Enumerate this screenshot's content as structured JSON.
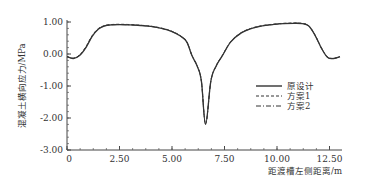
{
  "chart_data": {
    "type": "line",
    "title": "",
    "xlabel": "距渡槽左侧距离/m",
    "ylabel": "混凝土横向应力/MPa",
    "xlim": [
      0,
      13.2
    ],
    "ylim": [
      -3.0,
      1.0
    ],
    "x_ticks": [
      0,
      2.5,
      5.0,
      7.5,
      10.0,
      12.5
    ],
    "x_tick_labels": [
      "0",
      "2.50",
      "5.00",
      "7.50",
      "10.00",
      "12.50"
    ],
    "y_ticks": [
      1.0,
      0.0,
      -1.0,
      -2.0,
      -3.0
    ],
    "y_tick_labels": [
      "1.00",
      "0.00",
      "-1.00",
      "-2.00",
      "-3.00"
    ],
    "grid": false,
    "legend_position": "right-center",
    "x": [
      0,
      0.3,
      0.6,
      0.9,
      1.2,
      1.5,
      1.8,
      2.1,
      2.5,
      3.0,
      3.5,
      4.0,
      4.5,
      5.0,
      5.4,
      5.7,
      5.95,
      6.2,
      6.4,
      6.6,
      6.85,
      7.1,
      7.4,
      7.8,
      8.3,
      8.8,
      9.3,
      9.8,
      10.3,
      10.8,
      11.2,
      11.5,
      11.8,
      12.1,
      12.4,
      12.7,
      13.0
    ],
    "series": [
      {
        "name": "原设计",
        "style": "solid",
        "values": [
          -0.08,
          -0.14,
          -0.05,
          0.2,
          0.55,
          0.78,
          0.88,
          0.91,
          0.92,
          0.91,
          0.89,
          0.86,
          0.8,
          0.7,
          0.56,
          0.38,
          -0.05,
          -0.38,
          -0.85,
          -2.2,
          -0.85,
          -0.38,
          -0.05,
          0.38,
          0.66,
          0.8,
          0.88,
          0.92,
          0.95,
          0.96,
          0.95,
          0.88,
          0.6,
          0.2,
          -0.1,
          -0.14,
          -0.08
        ]
      },
      {
        "name": "方案1",
        "style": "dashed",
        "values": [
          -0.08,
          -0.13,
          -0.03,
          0.23,
          0.58,
          0.8,
          0.89,
          0.92,
          0.93,
          0.92,
          0.9,
          0.87,
          0.81,
          0.71,
          0.57,
          0.39,
          -0.04,
          -0.37,
          -0.84,
          -2.18,
          -0.84,
          -0.37,
          -0.04,
          0.39,
          0.67,
          0.81,
          0.89,
          0.93,
          0.96,
          0.97,
          0.96,
          0.89,
          0.61,
          0.21,
          -0.09,
          -0.13,
          -0.08
        ]
      },
      {
        "name": "方案2",
        "style": "dash-dot",
        "values": [
          -0.08,
          -0.13,
          -0.04,
          0.21,
          0.56,
          0.79,
          0.88,
          0.91,
          0.92,
          0.91,
          0.89,
          0.86,
          0.8,
          0.7,
          0.56,
          0.38,
          -0.05,
          -0.38,
          -0.85,
          -2.19,
          -0.85,
          -0.38,
          -0.05,
          0.38,
          0.66,
          0.8,
          0.88,
          0.92,
          0.95,
          0.96,
          0.95,
          0.88,
          0.6,
          0.2,
          -0.1,
          -0.14,
          -0.08
        ]
      }
    ]
  },
  "legend": {
    "items": [
      {
        "label": "原设计"
      },
      {
        "label": "方案1"
      },
      {
        "label": "方案2"
      }
    ]
  },
  "colors": {
    "line": "#333333",
    "axis": "#444444",
    "background": "#ffffff"
  }
}
